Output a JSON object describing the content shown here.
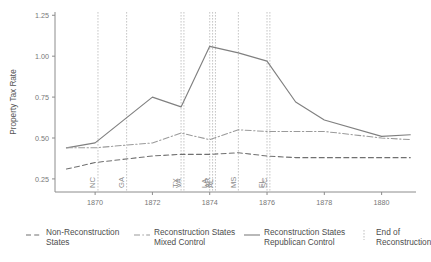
{
  "chart_data": {
    "type": "line",
    "title": "",
    "xlabel": "",
    "ylabel": "Property Tax Rate",
    "xlim": [
      1868.6,
      1881.2
    ],
    "ylim": [
      0.17,
      1.27
    ],
    "xticks": [
      1870,
      1872,
      1874,
      1876,
      1878,
      1880
    ],
    "yticks": [
      0.25,
      0.5,
      0.75,
      1.0,
      1.25
    ],
    "ytick_labels": [
      "0.25",
      "0.50",
      "0.75",
      "1.00",
      "1.25"
    ],
    "xtick_labels": [
      "1870",
      "1872",
      "1874",
      "1876",
      "1878",
      "1880"
    ],
    "grid": "vertical-only",
    "legend_position": "below",
    "series": [
      {
        "name": "Reconstruction States Republican Control",
        "style": "solid",
        "color": "#808080",
        "x": [
          1869,
          1870,
          1872,
          1873,
          1874,
          1875,
          1876,
          1877,
          1878,
          1880,
          1881
        ],
        "values": [
          0.44,
          0.47,
          0.75,
          0.69,
          1.06,
          1.02,
          0.97,
          0.72,
          0.61,
          0.51,
          0.52
        ]
      },
      {
        "name": "Reconstruction States Mixed Control",
        "style": "dashdot",
        "color": "#9a9a9a",
        "x": [
          1869,
          1870,
          1872,
          1873,
          1874,
          1875,
          1876,
          1877,
          1878,
          1880,
          1881
        ],
        "values": [
          0.44,
          0.44,
          0.47,
          0.53,
          0.49,
          0.55,
          0.54,
          0.54,
          0.54,
          0.5,
          0.49
        ]
      },
      {
        "name": "Non-Reconstruction States",
        "style": "dashed",
        "color": "#707070",
        "x": [
          1869,
          1870,
          1872,
          1873,
          1874,
          1875,
          1876,
          1877,
          1878,
          1880,
          1881
        ],
        "values": [
          0.31,
          0.35,
          0.39,
          0.4,
          0.4,
          0.41,
          0.39,
          0.38,
          0.38,
          0.38,
          0.38
        ]
      }
    ],
    "event_lines": [
      {
        "label": "NC",
        "x": 1870.1
      },
      {
        "label": "GA",
        "x": 1871.1
      },
      {
        "label": "TX",
        "x": 1873.0
      },
      {
        "label": "VA",
        "x": 1873.1
      },
      {
        "label": "LA",
        "x": 1874.0
      },
      {
        "label": "AR",
        "x": 1874.1
      },
      {
        "label": "AL",
        "x": 1874.2
      },
      {
        "label": "MS",
        "x": 1875.0
      },
      {
        "label": "FL",
        "x": 1876.0
      },
      {
        "label": "SC",
        "x": 1876.1
      }
    ],
    "annotations": []
  },
  "legend": {
    "entries": [
      {
        "label": "Non-Reconstruction\nStates",
        "style": "dashed"
      },
      {
        "label": "Reconstruction States\nMixed Control",
        "style": "dashdot"
      },
      {
        "label": "Reconstruction States\nRepublican Control",
        "style": "solid"
      },
      {
        "label": "End of\nReconstruction",
        "style": "vline"
      }
    ]
  }
}
